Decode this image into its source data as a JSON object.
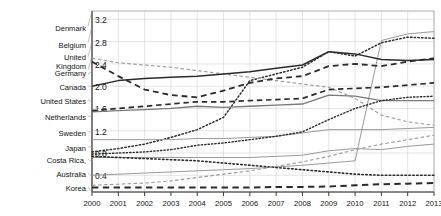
{
  "chart_data": {
    "type": "line",
    "title": "",
    "xlabel": "",
    "ylabel": "",
    "x": [
      2000,
      2001,
      2002,
      2003,
      2004,
      2005,
      2006,
      2007,
      2008,
      2009,
      2010,
      2011,
      2012,
      2013
    ],
    "xtick_labels": [
      "2000",
      "2001",
      "2002",
      "2003",
      "2004",
      "2005",
      "2006",
      "2007",
      "2008",
      "2009",
      "2010",
      "2011",
      "2012",
      "2013"
    ],
    "ytick_labels": [
      "0.4",
      "0.8",
      "1.2",
      "1.6",
      "2.0",
      "2.4",
      "2.8",
      "3.2"
    ],
    "ytick_values": [
      0.4,
      0.8,
      1.2,
      1.6,
      2.0,
      2.4,
      2.8,
      3.2
    ],
    "ylim": [
      0.1,
      3.35
    ],
    "xlim": [
      2000,
      2013
    ],
    "grid": true,
    "legend_position": "left-labels",
    "series": [
      {
        "name": "Denmark",
        "style": "solid",
        "color": "#9a9a9a",
        "width": 1.0,
        "values": [
          0.4,
          0.42,
          0.44,
          0.46,
          0.48,
          0.5,
          0.52,
          0.55,
          0.58,
          0.62,
          0.66,
          2.82,
          2.94,
          2.98
        ]
      },
      {
        "name": "Belgium",
        "style": "dotted",
        "color": "#2b2b2b",
        "width": 1.5,
        "values": [
          0.82,
          0.88,
          0.96,
          1.08,
          1.22,
          1.44,
          2.1,
          2.22,
          2.34,
          2.62,
          2.54,
          2.78,
          2.88,
          2.86
        ]
      },
      {
        "name": "United Kingdom",
        "style": "dashed",
        "color": "#9a9a9a",
        "width": 1.1,
        "values": [
          2.5,
          2.42,
          2.38,
          2.34,
          2.28,
          2.22,
          2.16,
          2.1,
          2.04,
          1.98,
          1.78,
          1.48,
          1.36,
          1.3
        ]
      },
      {
        "name": "Germany",
        "style": "dashed",
        "color": "#2b2b2b",
        "width": 1.8,
        "values": [
          2.44,
          2.18,
          1.94,
          1.84,
          1.8,
          1.92,
          2.06,
          2.14,
          2.18,
          2.36,
          2.4,
          2.36,
          2.44,
          2.5
        ]
      },
      {
        "name": "Canada",
        "style": "solid",
        "color": "#2b2b2b",
        "width": 1.5,
        "values": [
          2.0,
          2.1,
          2.14,
          2.16,
          2.18,
          2.22,
          2.26,
          2.32,
          2.38,
          2.62,
          2.58,
          2.48,
          2.46,
          2.48
        ]
      },
      {
        "name": "United States",
        "style": "solid",
        "color": "#7a7a7a",
        "width": 1.3,
        "values": [
          1.54,
          1.56,
          1.58,
          1.6,
          1.64,
          1.62,
          1.64,
          1.66,
          1.68,
          1.84,
          1.82,
          1.74,
          1.74,
          1.74
        ]
      },
      {
        "name": "Netherlands",
        "style": "dashed",
        "color": "#2b2b2b",
        "width": 1.7,
        "values": [
          1.56,
          1.6,
          1.64,
          1.68,
          1.72,
          1.72,
          1.74,
          1.76,
          1.78,
          1.94,
          1.96,
          1.98,
          2.02,
          2.06
        ]
      },
      {
        "name": "Sweden",
        "style": "solid",
        "color": "#9a9a9a",
        "width": 1.0,
        "values": [
          1.04,
          1.04,
          1.04,
          1.04,
          1.06,
          1.06,
          1.08,
          1.1,
          1.16,
          1.22,
          1.22,
          1.22,
          1.24,
          1.26
        ]
      },
      {
        "name": "Japan",
        "style": "dotted",
        "color": "#2b2b2b",
        "width": 1.4,
        "values": [
          0.78,
          0.8,
          0.82,
          0.86,
          0.94,
          0.98,
          1.04,
          1.1,
          1.18,
          1.4,
          1.6,
          1.74,
          1.8,
          1.82
        ]
      },
      {
        "name": "Costa Rica",
        "style": "solid",
        "color": "#9a9a9a",
        "width": 1.0,
        "values": [
          0.72,
          0.72,
          0.72,
          0.72,
          0.72,
          0.72,
          0.72,
          0.74,
          0.76,
          0.84,
          0.88,
          0.86,
          0.92,
          0.96
        ]
      },
      {
        "name": "Australia",
        "style": "dotted",
        "color": "#2b2b2b",
        "width": 1.6,
        "values": [
          0.74,
          0.72,
          0.7,
          0.68,
          0.66,
          0.62,
          0.58,
          0.54,
          0.5,
          0.46,
          0.42,
          0.4,
          0.4,
          0.4
        ]
      },
      {
        "name": "Korea",
        "style": "dashed",
        "color": "#9a9a9a",
        "width": 1.1,
        "values": [
          0.22,
          0.24,
          0.26,
          0.3,
          0.36,
          0.42,
          0.48,
          0.56,
          0.64,
          0.74,
          0.86,
          0.96,
          1.04,
          1.12
        ]
      },
      {
        "name": "Korea-baseline",
        "style": "dashed",
        "color": "#2b2b2b",
        "width": 2.0,
        "values": [
          0.18,
          0.18,
          0.18,
          0.18,
          0.18,
          0.18,
          0.18,
          0.19,
          0.19,
          0.2,
          0.22,
          0.24,
          0.25,
          0.26
        ]
      }
    ],
    "country_labels": [
      {
        "label": "Denmark",
        "y": 28
      },
      {
        "label": "Belgium",
        "y": 45
      },
      {
        "label": "United",
        "y": 57
      },
      {
        "label": "Kingdom",
        "y": 66
      },
      {
        "label": "Germany",
        "y": 73
      },
      {
        "label": "Canada",
        "y": 87
      },
      {
        "label": "United States",
        "y": 101
      },
      {
        "label": "Netherlands",
        "y": 117
      },
      {
        "label": "Sweden",
        "y": 133
      },
      {
        "label": "Japan",
        "y": 148
      },
      {
        "label": "Costa Rica,",
        "y": 160
      },
      {
        "label": "Australia",
        "y": 174
      },
      {
        "label": "Korea",
        "y": 188
      }
    ]
  }
}
